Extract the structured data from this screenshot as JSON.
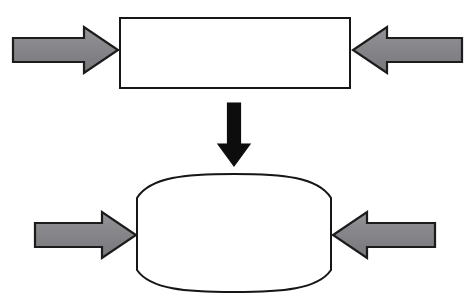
{
  "figure": {
    "background_color": "#ffffff",
    "width": 469,
    "height": 305
  },
  "style": {
    "arrow_fill": "#87878a",
    "arrow_fill_light": "#9a9a9d",
    "arrow_fill_dark": "#6f6f73",
    "arrow_stroke": "#1a1a1a",
    "arrow_stroke_width": 2.2,
    "black_arrow_fill": "#0b0b0b",
    "shape_stroke": "#141414",
    "shape_stroke_width": 2.0,
    "shape_fill": "#ffffff"
  },
  "shapes": {
    "undeformed_block": {
      "label": "undeformed rectangular block",
      "type": "rectangle",
      "x": 120,
      "y": 18,
      "width": 230,
      "height": 70
    },
    "deformed_block": {
      "label": "deformed barrelled block",
      "type": "barrel",
      "left": 137,
      "right": 331,
      "top": 174,
      "bottom": 292,
      "side_top": 198,
      "side_bottom": 270,
      "bulge": 24
    }
  },
  "arrows": {
    "top_left_load": {
      "label": "left compressive load on undeformed block",
      "direction": "right",
      "tail_x": 13,
      "tip_x": 118,
      "center_y": 50,
      "shaft_half_height": 12,
      "head_half_height": 23,
      "head_length": 34,
      "fill": "#87878a"
    },
    "top_right_load": {
      "label": "right compressive load on undeformed block",
      "direction": "left",
      "tail_x": 462,
      "tip_x": 353,
      "center_y": 50,
      "shaft_half_height": 12,
      "head_half_height": 23,
      "head_length": 34,
      "fill": "#87878a"
    },
    "transition": {
      "label": "transition to deformed state",
      "direction": "down",
      "center_x": 234,
      "tail_y": 103,
      "tip_y": 166,
      "shaft_half_width": 6.5,
      "head_half_width": 16,
      "head_length": 22,
      "fill": "#0b0b0b"
    },
    "bottom_left_load": {
      "label": "left compressive load on deformed block",
      "direction": "right",
      "tail_x": 35,
      "tip_x": 136,
      "center_y": 235,
      "shaft_half_height": 12,
      "head_half_height": 23,
      "head_length": 34,
      "fill": "#87878a"
    },
    "bottom_right_load": {
      "label": "right compressive load on deformed block",
      "direction": "left",
      "tail_x": 435,
      "tip_x": 333,
      "center_y": 235,
      "shaft_half_height": 12,
      "head_half_height": 23,
      "head_length": 34,
      "fill": "#87878a"
    }
  }
}
